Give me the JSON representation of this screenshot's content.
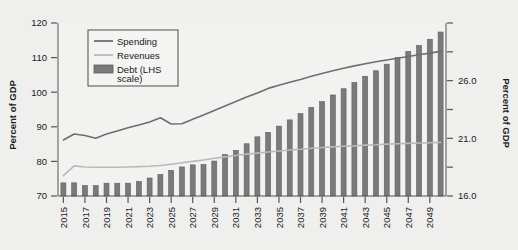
{
  "chart_data": {
    "type": "bar",
    "title": "",
    "subtitle": "",
    "ylabel": "Percent of GDP",
    "ylabel_right": "Percent of GDP",
    "xlabel": "",
    "ylim": [
      70,
      120
    ],
    "ylim_right": [
      16.0,
      31.0
    ],
    "yticks": [
      70,
      80,
      90,
      100,
      110,
      120
    ],
    "ytick_labels": [
      "70",
      "80",
      "90",
      "100",
      "110",
      "120"
    ],
    "yticks_right": [
      16.0,
      18.5,
      21.0,
      23.5,
      26.0,
      28.5,
      31.0
    ],
    "ytick_labels_right": [
      "16.0",
      "",
      "21.0",
      "",
      "26.0",
      "",
      ""
    ],
    "grid": false,
    "legend_position": "upper-left",
    "legend": [
      {
        "label": "Spending",
        "type": "line",
        "color": "#6e6e6e"
      },
      {
        "label": "Revenues",
        "type": "line",
        "color": "#b4b4b4"
      },
      {
        "label": "Debt (LHS scale)",
        "type": "bar",
        "color": "#7a7a7a"
      }
    ],
    "x": [
      2015,
      2016,
      2017,
      2018,
      2019,
      2020,
      2021,
      2022,
      2023,
      2024,
      2025,
      2026,
      2027,
      2028,
      2029,
      2030,
      2031,
      2032,
      2033,
      2034,
      2035,
      2036,
      2037,
      2038,
      2039,
      2040,
      2041,
      2042,
      2043,
      2044,
      2045,
      2046,
      2047,
      2048,
      2049,
      2050
    ],
    "xtick_labels": [
      "2015",
      "",
      "2017",
      "",
      "2019",
      "",
      "2021",
      "",
      "2023",
      "",
      "2025",
      "",
      "2027",
      "",
      "2029",
      "",
      "2031",
      "",
      "2033",
      "",
      "2035",
      "",
      "2037",
      "",
      "2039",
      "",
      "2041",
      "",
      "2043",
      "",
      "2045",
      "",
      "2047",
      "",
      "2049",
      ""
    ],
    "series": [
      {
        "name": "Debt (LHS scale)",
        "axis": "left",
        "type": "bar",
        "values": [
          73.8,
          73.8,
          73.0,
          73.0,
          73.7,
          73.7,
          73.7,
          74.2,
          75.2,
          76.2,
          77.4,
          78.4,
          79.0,
          79.1,
          80.1,
          82.0,
          83.2,
          85.1,
          87.1,
          88.4,
          90.2,
          92.0,
          93.8,
          95.6,
          97.3,
          99.2,
          101.0,
          102.8,
          104.6,
          106.2,
          108.1,
          110.0,
          111.8,
          113.5,
          115.3,
          117.4
        ]
      },
      {
        "name": "Spending",
        "axis": "right",
        "type": "line",
        "values_left_scale": [
          86.2,
          87.9,
          87.5,
          86.7,
          87.9,
          88.8,
          89.7,
          90.5,
          91.4,
          92.6,
          90.8,
          90.9,
          92.2,
          93.4,
          94.7,
          96.0,
          97.3,
          98.6,
          99.8,
          101.1,
          102.0,
          102.9,
          103.7,
          104.6,
          105.4,
          106.2,
          106.9,
          107.6,
          108.2,
          108.8,
          109.3,
          109.8,
          110.3,
          110.8,
          111.3,
          111.8
        ],
        "values": [
          26.9,
          27.4,
          27.3,
          27.0,
          27.4,
          27.6,
          27.9,
          28.2,
          28.4,
          28.8,
          28.2,
          28.3,
          28.7,
          29.0,
          29.4,
          29.8,
          30.2,
          30.6,
          30.9,
          31.3,
          31.6,
          31.9,
          32.1,
          32.4,
          32.6,
          32.9,
          33.1,
          33.3,
          33.5,
          33.6,
          33.8,
          33.9,
          34.1,
          34.2,
          34.4,
          34.5
        ]
      },
      {
        "name": "Revenues",
        "axis": "right",
        "type": "line",
        "values_left_scale": [
          75.9,
          78.7,
          78.4,
          78.3,
          78.3,
          78.3,
          78.4,
          78.5,
          78.6,
          78.8,
          79.2,
          79.6,
          80.0,
          80.4,
          80.9,
          81.3,
          81.7,
          82.1,
          82.4,
          82.7,
          83.0,
          83.3,
          83.5,
          83.8,
          84.0,
          84.2,
          84.4,
          84.5,
          84.7,
          84.8,
          85.0,
          85.1,
          85.2,
          85.3,
          85.4,
          85.5
        ],
        "values": [
          23.9,
          24.8,
          24.7,
          24.7,
          24.7,
          24.7,
          24.7,
          24.8,
          24.8,
          24.9,
          25.0,
          25.2,
          25.3,
          25.4,
          25.6,
          25.7,
          25.8,
          26.0,
          26.1,
          26.2,
          26.3,
          26.3,
          26.4,
          26.5,
          26.6,
          26.6,
          26.7,
          26.7,
          26.8,
          26.8,
          26.9,
          26.9,
          27.0,
          27.0,
          27.0,
          27.1
        ]
      }
    ]
  },
  "colors": {
    "background": "#efefed",
    "plot_background": "#f2f2f0",
    "bar": "#7a7a7a",
    "bar_edge": "#5e5e5e",
    "spending_line": "#6e6e6e",
    "revenues_line": "#b9b9b9",
    "axis": "#555555",
    "text": "#1a1a1a"
  },
  "axis_titles": {
    "left": "Percent of GDP",
    "right": "Percent of GDP"
  }
}
